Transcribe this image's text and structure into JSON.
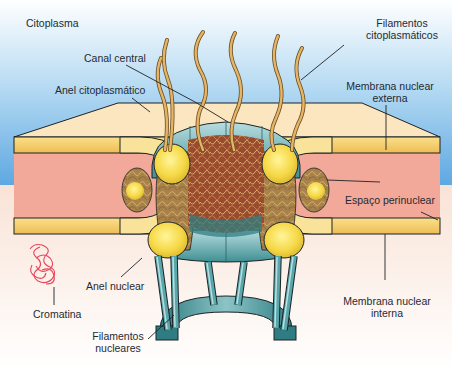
{
  "diagram": {
    "regions": {
      "top": "Citoplasma"
    },
    "labels": {
      "citoplasma": "Citoplasma",
      "filamentos_citoplasmaticos_1": "Filamentos",
      "filamentos_citoplasmaticos_2": "citoplasmáticos",
      "canal_central": "Canal central",
      "anel_citoplasmatico": "Anel citoplasmático",
      "membrana_externa_1": "Membrana nuclear",
      "membrana_externa_2": "externa",
      "espaco_perinuclear": "Espaço perinuclear",
      "anel_nuclear": "Anel nuclear",
      "cromatina": "Cromatina",
      "membrana_interna_1": "Membrana nuclear",
      "membrana_interna_2": "interna",
      "filamentos_nucleares_1": "Filamentos",
      "filamentos_nucleares_2": "nucleares"
    },
    "colors": {
      "cytoplasm_top": "#ffffff",
      "cytoplasm_blue": "#6fb2e6",
      "membrane_surface": "#fbe6bf",
      "membrane_edge": "#f3c766",
      "perinuclear_space": "#f2a99a",
      "ring_yellow": "#f7df5a",
      "pore_teal": "#3f8f93",
      "pore_light": "#a9d3d6",
      "filament_tan": "#d9a95a",
      "chromatin": "#e8455a",
      "nucleoplasm": "#fbf1e6",
      "outline": "#1d2326"
    }
  }
}
